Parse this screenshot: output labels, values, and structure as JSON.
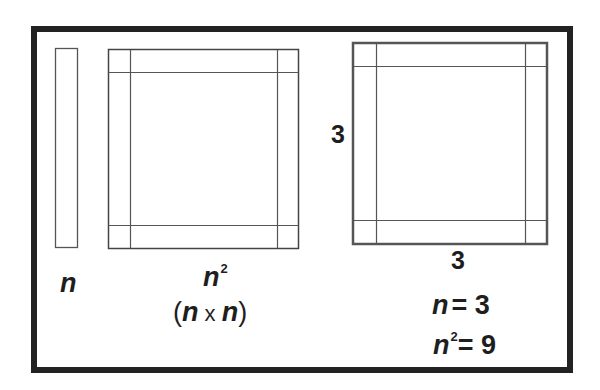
{
  "diagram": {
    "title": "",
    "colors": {
      "frame": "#222222",
      "lines": "#555555",
      "text": "#1e1e1e",
      "background": "#ffffff"
    },
    "shapes": [
      {
        "id": "strip",
        "label": "n",
        "description": "thin vertical strip of length n"
      },
      {
        "id": "square-n",
        "label": "n^2",
        "sublabel": "(n x n)",
        "description": "square with corner cells"
      },
      {
        "id": "square-3",
        "side_left": "3",
        "side_bottom": "3",
        "description": "3 by 3 square with corner cells"
      }
    ],
    "labels": {
      "strip_n": "n",
      "square_n": "n",
      "square_n_exp": "2",
      "square_n_paren_open": "(",
      "square_n_paren_n1": "n",
      "square_n_times": " x ",
      "square_n_paren_n2": "n",
      "square_n_paren_close": ")",
      "side_left": "3",
      "side_bottom": "3",
      "eq1_var": "n",
      "eq1_rest": "= 3",
      "eq2_var": "n",
      "eq2_exp": "2",
      "eq2_rest": "= 9"
    }
  }
}
